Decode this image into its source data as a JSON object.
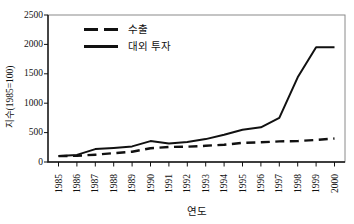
{
  "figure": {
    "background": "#ffffff",
    "line_color": "#111111",
    "frame_color": "#8a8a8a"
  },
  "chart_data": {
    "type": "line",
    "title": "",
    "xlabel": "연도",
    "ylabel": "지수(1985=100)",
    "x": [
      1985,
      1986,
      1987,
      1988,
      1989,
      1990,
      1991,
      1992,
      1993,
      1994,
      1995,
      1996,
      1997,
      1998,
      1999,
      2000
    ],
    "ylim": [
      0,
      2500
    ],
    "yticks": [
      0,
      500,
      1000,
      1500,
      2000,
      2500
    ],
    "grid": false,
    "legend_position": "inside-top-left",
    "series": [
      {
        "name": "수출",
        "style": "dashed",
        "color": "#111111",
        "values": [
          100,
          105,
          125,
          150,
          175,
          235,
          255,
          260,
          275,
          295,
          325,
          335,
          350,
          355,
          375,
          400
        ]
      },
      {
        "name": "대외 투자",
        "style": "solid",
        "color": "#111111",
        "values": [
          100,
          120,
          220,
          240,
          265,
          355,
          315,
          340,
          390,
          465,
          550,
          590,
          750,
          1440,
          1950,
          1950
        ]
      }
    ]
  }
}
